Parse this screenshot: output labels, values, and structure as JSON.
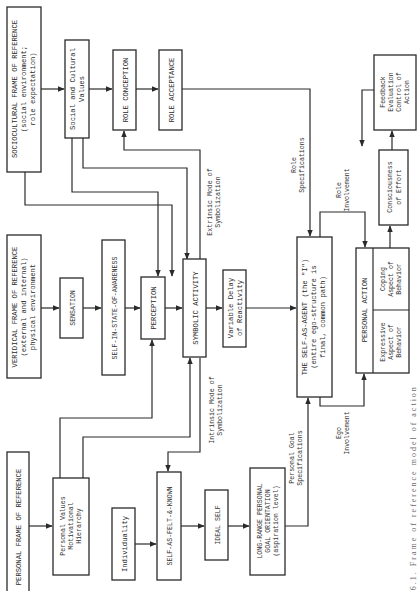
{
  "figure": {
    "orientation": "rotated-90-ccw",
    "caption": "Fig. 6.1.   Frame of reference model of action",
    "line_color": "#2a2a2a",
    "background": "#ffffff"
  },
  "nodes": {
    "sociocultural": {
      "lines": [
        "SOCIOCULTURAL FRAME OF REFERENCE",
        "(social environment;",
        "role expectation)"
      ]
    },
    "social_values": {
      "lines": [
        "Social and Cultural",
        "Values"
      ]
    },
    "role_conception": {
      "lines": [
        "ROLE CONCEPTION"
      ]
    },
    "role_acceptance": {
      "lines": [
        "ROLE ACCEPTANCE"
      ]
    },
    "veridical": {
      "lines": [
        "VERIDICAL FRAME OF REFERENCE",
        "(external and internal)",
        "physical environment"
      ]
    },
    "sensation": {
      "lines": [
        "SENSATION"
      ]
    },
    "self_awareness": {
      "lines": [
        "SELF-IN-STATE-OF-AWARENESS"
      ]
    },
    "perception": {
      "lines": [
        "PERCEPTION"
      ]
    },
    "symbolic_activity": {
      "lines": [
        "SYMBOLIC ACTIVITY"
      ]
    },
    "variable_delay": {
      "lines": [
        "Variable Delay",
        "of Reactivity"
      ]
    },
    "self_agent": {
      "lines": [
        "THE SELF-AS-AGENT (the \"I\")",
        "(entire ego-structure is",
        "final, common path)"
      ]
    },
    "personal_action": {
      "lines": [
        "PERSONAL ACTION"
      ]
    },
    "expressive": {
      "lines": [
        "Expressive",
        "Aspect of",
        "Behavior"
      ]
    },
    "coping": {
      "lines": [
        "Coping",
        "Aspect of",
        "Behavior"
      ]
    },
    "consciousness_effort": {
      "lines": [
        "Consciousness",
        "of Effort"
      ]
    },
    "feedback": {
      "lines": [
        "Feedback",
        "Evaluation",
        "Control of",
        "Action"
      ]
    },
    "personal_for": {
      "lines": [
        "PERSONAL FRAME OF REFERENCE"
      ]
    },
    "personal_values": {
      "lines": [
        "Personal Values",
        "Motivational",
        "Hierarchy"
      ]
    },
    "individuality": {
      "lines": [
        "Individuality"
      ]
    },
    "self_felt_known": {
      "lines": [
        "SELF-AS-FELT-&-KNOWN"
      ]
    },
    "ideal_self": {
      "lines": [
        "IDEAL SELF"
      ]
    },
    "long_range": {
      "lines": [
        "LONG-RANGE PERSONAL",
        "GOAL ORIENTATION",
        "(aspiration level)"
      ]
    }
  },
  "edge_labels": {
    "extrinsic": [
      "Extrinsic Mode of",
      "Symbolization"
    ],
    "intrinsic": [
      "Intrinsic Mode of",
      "Symbolization"
    ],
    "role_specs": [
      "Role",
      "Specifications"
    ],
    "role_involvement": [
      "Role",
      "Involvement"
    ],
    "personal_goal_specs": [
      "Personal Goal",
      "Specifications"
    ],
    "ego_involvement": [
      "Ego",
      "Involvement"
    ]
  }
}
